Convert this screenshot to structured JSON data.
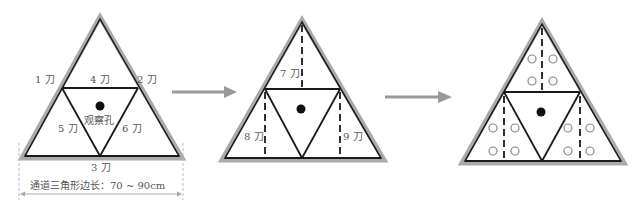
{
  "diagram": {
    "step1": {
      "labels": {
        "cut1": "1 刀",
        "cut2": "2 刀",
        "cut3": "3 刀",
        "cut4": "4 刀",
        "cut5": "5 刀",
        "cut6": "6 刀",
        "center": "观察孔"
      },
      "dimension": "通道三角形边长：70 ~ 90cm"
    },
    "step2": {
      "labels": {
        "cut7": "7 刀",
        "cut8": "8 刀",
        "cut9": "9 刀"
      }
    },
    "step3": {
      "circles_per_section": 4
    },
    "colors": {
      "outline_gray": "#aaaaaa",
      "line": "#1a1a1a",
      "arrow": "#999999",
      "text": "#555555"
    }
  }
}
